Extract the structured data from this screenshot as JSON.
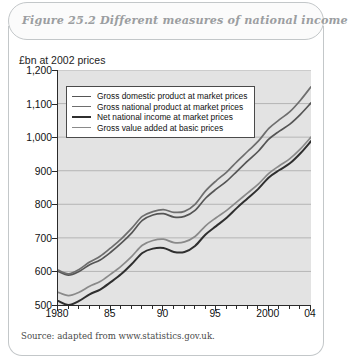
{
  "figure": {
    "title": "Figure 25.2  Different measures of national income",
    "source": "Source: adapted from www.statistics.gov.uk."
  },
  "chart_data": {
    "type": "line",
    "title": "Figure 25.2  Different measures of national income",
    "xlabel": "",
    "ylabel": "£bn at 2002 prices",
    "ylim": [
      500,
      1200
    ],
    "xlim": [
      1980,
      2004
    ],
    "y_ticks": [
      "500",
      "600",
      "700",
      "800",
      "900",
      "1,000",
      "1,100",
      "1,200"
    ],
    "y_tick_values": [
      500,
      600,
      700,
      800,
      900,
      1000,
      1100,
      1200
    ],
    "x_ticks": [
      "1980",
      "85",
      "90",
      "95",
      "2000",
      "04"
    ],
    "x_tick_values": [
      1980,
      1985,
      1990,
      1995,
      2000,
      2004
    ],
    "x": [
      1980,
      1981,
      1982,
      1983,
      1984,
      1985,
      1986,
      1987,
      1988,
      1989,
      1990,
      1991,
      1992,
      1993,
      1994,
      1995,
      1996,
      1997,
      1998,
      1999,
      2000,
      2001,
      2002,
      2003,
      2004
    ],
    "grid": "horizontal",
    "legend_position": "upper-left",
    "series": [
      {
        "name": "Gross domestic product at market prices",
        "color": "#555555",
        "width": 1.7,
        "values": [
          600,
          589,
          600,
          620,
          634,
          657,
          684,
          715,
          752,
          768,
          772,
          762,
          764,
          782,
          818,
          845,
          869,
          899,
          929,
          958,
          994,
          1018,
          1039,
          1068,
          1102
        ]
      },
      {
        "name": "Gross national product at market prices",
        "color": "#6e6e6e",
        "width": 1.7,
        "values": [
          604,
          593,
          606,
          628,
          645,
          670,
          697,
          729,
          764,
          778,
          784,
          776,
          779,
          800,
          840,
          870,
          896,
          928,
          958,
          988,
          1026,
          1052,
          1076,
          1110,
          1150
        ]
      },
      {
        "name": "Net national income at market prices",
        "color": "#2f2f2f",
        "width": 2.0,
        "values": [
          512,
          500,
          512,
          532,
          546,
          568,
          592,
          622,
          655,
          668,
          670,
          658,
          658,
          676,
          710,
          735,
          760,
          790,
          818,
          846,
          880,
          902,
          922,
          952,
          988
        ]
      },
      {
        "name": "Gross value added at basic prices",
        "color": "#8a8a8a",
        "width": 1.7,
        "values": [
          538,
          528,
          538,
          556,
          570,
          592,
          616,
          645,
          678,
          692,
          696,
          686,
          688,
          704,
          736,
          760,
          782,
          808,
          834,
          860,
          892,
          915,
          936,
          965,
          1000
        ]
      }
    ]
  },
  "legend": {
    "items": [
      {
        "label": "Gross domestic product at market prices",
        "color": "#555555",
        "width": 1.7
      },
      {
        "label": "Gross national product at market prices",
        "color": "#6e6e6e",
        "width": 1.7
      },
      {
        "label": "Net national income at market prices",
        "color": "#2f2f2f",
        "width": 2.2
      },
      {
        "label": "Gross value added at basic prices",
        "color": "#8a8a8a",
        "width": 1.5
      }
    ]
  }
}
